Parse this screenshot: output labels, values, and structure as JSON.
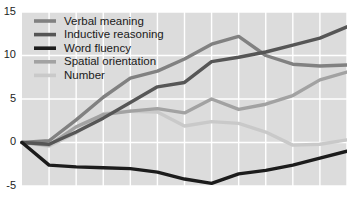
{
  "chart_data": {
    "type": "line",
    "title": "",
    "subtitle": "",
    "xlabel": "",
    "ylabel": "",
    "ylim": [
      -5,
      15
    ],
    "xlim": [
      0,
      12
    ],
    "grid": true,
    "grid_color": "#ffffff",
    "plot_background": "#dcdcdc",
    "page_background": "#ffffff",
    "legend_position": "top-left",
    "y_ticks": [
      15,
      10,
      5,
      0,
      -5
    ],
    "y_tick_labels": [
      "15",
      "10",
      "5",
      "0",
      "-5"
    ],
    "x_ticks": [
      0,
      1,
      2,
      3,
      4,
      5,
      6,
      7,
      8,
      9,
      10,
      11,
      12
    ],
    "x_tick_labels": [
      "",
      "",
      "",
      "",
      "",
      "",
      "",
      "",
      "",
      "",
      "",
      "",
      ""
    ],
    "x": [
      0,
      1,
      2,
      3,
      4,
      5,
      6,
      7,
      8,
      9,
      10,
      11,
      12
    ],
    "series": [
      {
        "name": "Verbal meaning",
        "color": "#818181",
        "width": 3.4,
        "values": [
          0,
          0.2,
          2.6,
          5.2,
          7.4,
          8.2,
          9.6,
          11.3,
          12.2,
          10.0,
          9.0,
          8.8,
          8.9
        ]
      },
      {
        "name": "Inductive reasoning",
        "color": "#565656",
        "width": 3.4,
        "values": [
          0,
          -0.2,
          1.2,
          2.8,
          4.6,
          6.4,
          6.9,
          9.3,
          9.8,
          10.4,
          11.2,
          12.0,
          13.3
        ]
      },
      {
        "name": "Word fluency",
        "color": "#1c1c1c",
        "width": 3.4,
        "values": [
          0,
          -2.6,
          -2.8,
          -2.9,
          -3.0,
          -3.4,
          -4.2,
          -4.7,
          -3.6,
          -3.2,
          -2.6,
          -1.8,
          -1.0
        ]
      },
      {
        "name": "Spatial orientation",
        "color": "#a2a2a2",
        "width": 3.4,
        "values": [
          0,
          -0.3,
          1.8,
          3.2,
          3.6,
          3.9,
          3.4,
          5.0,
          3.8,
          4.4,
          5.4,
          7.2,
          8.1
        ]
      },
      {
        "name": "Number",
        "color": "#c9c9c9",
        "width": 3.4,
        "values": [
          0,
          -0.4,
          1.1,
          3.3,
          3.6,
          3.5,
          1.9,
          2.4,
          2.2,
          1.2,
          -0.3,
          -0.2,
          0.3
        ]
      }
    ],
    "legend_entries": [
      {
        "label": "Verbal meaning",
        "color": "#818181"
      },
      {
        "label": "Inductive reasoning",
        "color": "#565656"
      },
      {
        "label": "Word fluency",
        "color": "#1c1c1c"
      },
      {
        "label": "Spatial orientation",
        "color": "#a2a2a2"
      },
      {
        "label": "Number",
        "color": "#c9c9c9"
      }
    ]
  },
  "layout": {
    "width": 347,
    "height": 206,
    "plot_left": 22,
    "plot_right": 347,
    "plot_top": 12,
    "plot_bottom": 186
  }
}
